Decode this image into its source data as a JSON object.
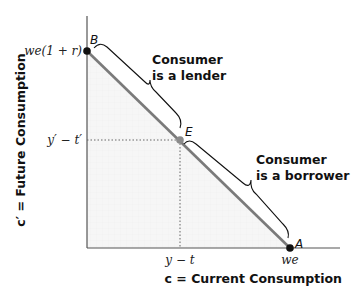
{
  "diagram": {
    "type": "budget-constraint",
    "y_axis_label": "c′ = Future Consumption",
    "x_axis_label": "c = Current Consumption",
    "y_intercept_label": "we(1 + r)",
    "y_mark_label": "y′ − t′",
    "x_mark_label": "y − t",
    "x_intercept_label": "we",
    "points": {
      "B": "B",
      "E": "E",
      "A": "A"
    },
    "annotations": {
      "lender_line1": "Consumer",
      "lender_line2": "is a lender",
      "borrower_line1": "Consumer",
      "borrower_line2": "is a borrower"
    },
    "colors": {
      "line": "#7a7a7a",
      "axis": "#555555",
      "fill": "#f3f3f3",
      "point": "#111111",
      "point_e": "#8a8a8a"
    }
  }
}
